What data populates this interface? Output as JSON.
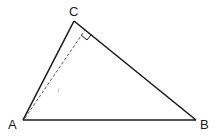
{
  "diagram": {
    "type": "geometry-triangle",
    "vertices": {
      "A": {
        "label": "A",
        "x": 23,
        "y": 120
      },
      "B": {
        "label": "B",
        "x": 196,
        "y": 120
      },
      "C": {
        "label": "C",
        "x": 74,
        "y": 21
      }
    },
    "sides": [
      "AB",
      "BC",
      "CA"
    ],
    "altitude": {
      "from": "A",
      "to_side": "BC",
      "style": "dashed",
      "right_angle_marker": true
    },
    "colors": {
      "stroke": "#1a1a1a",
      "dashed": "#555555",
      "background": "#ffffff"
    }
  }
}
